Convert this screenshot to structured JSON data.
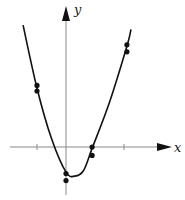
{
  "chart_data": {
    "type": "scatter",
    "title": "",
    "xlabel": "x",
    "ylabel": "y",
    "xlim": [
      -2.2,
      3.6
    ],
    "ylim": [
      -1.9,
      5.2
    ],
    "x_ticks": [
      -1,
      2
    ],
    "grid": false,
    "legend": "none",
    "series": [
      {
        "name": "data points",
        "kind": "scatter",
        "points": [
          {
            "x": -1,
            "y": 2.2
          },
          {
            "x": -1,
            "y": 2.0
          },
          {
            "x": 0,
            "y": -0.95
          },
          {
            "x": 0,
            "y": -1.2
          },
          {
            "x": 0.9,
            "y": 0.0
          },
          {
            "x": 0.9,
            "y": -0.3
          },
          {
            "x": 2.1,
            "y": 3.65
          },
          {
            "x": 2.1,
            "y": 3.4
          }
        ]
      },
      {
        "name": "fitted parabola",
        "kind": "curve",
        "points": [
          {
            "x": -1.48,
            "y": 4.35
          },
          {
            "x": -1.0,
            "y": 2.1
          },
          {
            "x": -0.5,
            "y": 0.3
          },
          {
            "x": 0.0,
            "y": -0.9
          },
          {
            "x": 0.3,
            "y": -1.04
          },
          {
            "x": 0.6,
            "y": -0.85
          },
          {
            "x": 0.9,
            "y": -0.05
          },
          {
            "x": 1.5,
            "y": 1.6
          },
          {
            "x": 2.1,
            "y": 3.6
          },
          {
            "x": 2.24,
            "y": 4.2
          }
        ]
      }
    ]
  }
}
